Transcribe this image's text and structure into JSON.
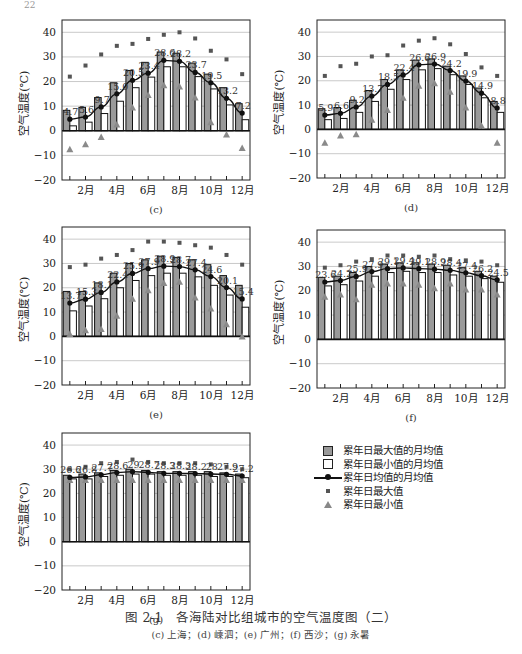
{
  "page_number": "22",
  "legend": {
    "items": [
      {
        "symbol": "gray-box",
        "label": "累年日最大值的月均值"
      },
      {
        "symbol": "white-box",
        "label": "累年日最小值的月均值"
      },
      {
        "symbol": "line-dot",
        "label": "累年日均值的月均值"
      },
      {
        "symbol": "small-square",
        "label": "累年日最大值"
      },
      {
        "symbol": "triangle",
        "label": "累年日最小值"
      }
    ]
  },
  "caption": {
    "title": "图 2-1　各海陆对比组城市的空气温度图（二）",
    "subtitle": "(c) 上海；(d) 嵊泗；(e) 广州；(f) 西沙；(g) 永暑"
  },
  "colors": {
    "bar_max_fill": "#9a9a9a",
    "bar_min_fill": "#ffffff",
    "bar_stroke": "#111111",
    "mean_line": "#111111",
    "extreme_max": "#555555",
    "extreme_min": "#8a8a8a",
    "gridline": "#bbbbbb"
  },
  "chart_data": [
    {
      "id": "c",
      "panel_label": "(c)",
      "type": "bar",
      "title": "",
      "xlabel": "",
      "ylabel": "空气温度(℃)",
      "ylim": [
        -20,
        45
      ],
      "yticks": [
        -20,
        -10,
        0,
        10,
        20,
        30,
        40
      ],
      "grid": true,
      "categories": [
        "1月",
        "2月",
        "3月",
        "4月",
        "5月",
        "6月",
        "7月",
        "8月",
        "9月",
        "10月",
        "11月",
        "12月"
      ],
      "xtick_labels": [
        "2月",
        "4月",
        "6月",
        "8月",
        "10月",
        "12月"
      ],
      "series": [
        {
          "name": "累年日最大值的月均值",
          "kind": "bar",
          "values": [
            8.3,
            9.5,
            13.5,
            19.5,
            24.5,
            27.8,
            32.0,
            31.5,
            27.5,
            23.0,
            17.5,
            11.0
          ]
        },
        {
          "name": "累年日最小值的月均值",
          "kind": "bar",
          "values": [
            2.0,
            3.5,
            7.0,
            12.0,
            17.5,
            21.8,
            26.0,
            26.0,
            22.0,
            17.0,
            10.5,
            4.5
          ]
        },
        {
          "name": "累年日均值的月均值",
          "kind": "line",
          "values": [
            4.7,
            5.6,
            9.7,
            15.0,
            20.5,
            23.4,
            28.6,
            28.2,
            23.7,
            19.5,
            13.2,
            7.2
          ],
          "labels": [
            "4.7",
            "5.6",
            "9.7",
            "15.0",
            "20.5",
            "23.4",
            "28.6",
            "28.2",
            "23.7",
            "19.5",
            "13.2",
            "7.2"
          ]
        },
        {
          "name": "累年日最大值",
          "kind": "scatter-square",
          "values": [
            22.0,
            26.5,
            31.0,
            34.5,
            35.3,
            37.3,
            39.0,
            40.0,
            37.5,
            32.5,
            29.0,
            23.0
          ]
        },
        {
          "name": "累年日最小值",
          "kind": "scatter-triangle",
          "values": [
            -7.5,
            -5.5,
            -2.5,
            2.5,
            9.5,
            14.5,
            18.5,
            18.0,
            13.5,
            3.5,
            -1.5,
            -7.0
          ]
        }
      ]
    },
    {
      "id": "d",
      "panel_label": "(d)",
      "type": "bar",
      "title": "",
      "xlabel": "",
      "ylabel": "空气温度(℃)",
      "ylim": [
        -20,
        45
      ],
      "yticks": [
        -20,
        -10,
        0,
        10,
        20,
        30,
        40
      ],
      "grid": true,
      "categories": [
        "1月",
        "2月",
        "3月",
        "4月",
        "5月",
        "6月",
        "7月",
        "8月",
        "9月",
        "10月",
        "11月",
        "12月"
      ],
      "xtick_labels": [
        "2月",
        "4月",
        "6月",
        "8月",
        "10月",
        "12月"
      ],
      "series": [
        {
          "name": "累年日最大值的月均值",
          "kind": "bar",
          "values": [
            8.5,
            9.0,
            12.0,
            16.0,
            20.5,
            24.5,
            28.5,
            29.0,
            26.0,
            22.0,
            17.0,
            11.5
          ]
        },
        {
          "name": "累年日最小值的月均值",
          "kind": "bar",
          "values": [
            4.0,
            4.5,
            7.0,
            11.5,
            16.5,
            20.5,
            24.5,
            25.0,
            22.5,
            18.5,
            13.0,
            7.0
          ]
        },
        {
          "name": "累年日均值的月均值",
          "kind": "line",
          "values": [
            5.9,
            6.6,
            9.2,
            13.7,
            18.5,
            22.4,
            26.6,
            26.9,
            24.2,
            19.9,
            14.9,
            8.8
          ],
          "labels": [
            "5.9",
            "6.6",
            "9.2",
            "13.7",
            "18.5",
            "22.4",
            "26.6",
            "26.9",
            "24.2",
            "19.9",
            "14.9",
            "8.8"
          ]
        },
        {
          "name": "累年日最大值",
          "kind": "scatter-square",
          "values": [
            22.0,
            26.0,
            27.0,
            30.0,
            30.5,
            34.5,
            36.5,
            37.5,
            35.0,
            31.0,
            25.5,
            22.0
          ]
        },
        {
          "name": "累年日最小值",
          "kind": "scatter-triangle",
          "values": [
            -5.5,
            -2.5,
            -2.0,
            4.0,
            8.0,
            13.0,
            18.0,
            19.0,
            15.5,
            9.0,
            1.5,
            -5.5
          ]
        }
      ]
    },
    {
      "id": "e",
      "panel_label": "(e)",
      "type": "bar",
      "title": "",
      "xlabel": "",
      "ylabel": "空气温度(℃)",
      "ylim": [
        -20,
        45
      ],
      "yticks": [
        -20,
        -10,
        0,
        10,
        20,
        30,
        40
      ],
      "grid": true,
      "categories": [
        "1月",
        "2月",
        "3月",
        "4月",
        "5月",
        "6月",
        "7月",
        "8月",
        "9月",
        "10月",
        "11月",
        "12月"
      ],
      "xtick_labels": [
        "2月",
        "4月",
        "6月",
        "8月",
        "10月",
        "12月"
      ],
      "series": [
        {
          "name": "累年日最大值的月均值",
          "kind": "bar",
          "values": [
            18.5,
            18.5,
            22.0,
            26.0,
            30.0,
            31.5,
            33.0,
            32.5,
            31.5,
            29.5,
            25.0,
            21.0
          ]
        },
        {
          "name": "累年日最小值的月均值",
          "kind": "bar",
          "values": [
            10.5,
            12.5,
            15.5,
            20.0,
            23.0,
            25.0,
            26.0,
            26.0,
            24.5,
            21.0,
            17.0,
            12.0
          ]
        },
        {
          "name": "累年日均值的月均值",
          "kind": "line",
          "values": [
            13.7,
            15.3,
            18.1,
            22.4,
            25.9,
            27.9,
            28.9,
            28.7,
            27.4,
            24.6,
            20.1,
            15.4
          ],
          "labels": [
            "13.7",
            "15.3",
            "18.1",
            "22.4",
            "25.9",
            "27.9",
            "28.9",
            "28.7",
            "27.4",
            "24.6",
            "20.1",
            "15.4"
          ]
        },
        {
          "name": "累年日最大值",
          "kind": "scatter-square",
          "values": [
            28.5,
            29.5,
            32.0,
            33.5,
            35.5,
            39.0,
            39.0,
            38.5,
            37.5,
            36.5,
            33.5,
            29.5
          ]
        },
        {
          "name": "累年日最小值",
          "kind": "scatter-triangle",
          "values": [
            1.0,
            2.5,
            3.0,
            8.5,
            15.5,
            19.0,
            22.0,
            22.5,
            16.0,
            11.5,
            5.0,
            0.0
          ]
        }
      ]
    },
    {
      "id": "f",
      "panel_label": "(f)",
      "type": "bar",
      "title": "",
      "xlabel": "",
      "ylabel": "空气温度(℃)",
      "ylim": [
        -20,
        45
      ],
      "yticks": [
        -20,
        -10,
        0,
        10,
        20,
        30,
        40
      ],
      "grid": true,
      "categories": [
        "1月",
        "2月",
        "3月",
        "4月",
        "5月",
        "6月",
        "7月",
        "8月",
        "9月",
        "10月",
        "11月",
        "12月"
      ],
      "xtick_labels": [
        "2月",
        "4月",
        "6月",
        "8月",
        "10月",
        "12月"
      ],
      "series": [
        {
          "name": "累年日最大值的月均值",
          "kind": "bar",
          "values": [
            25.5,
            26.0,
            27.5,
            30.0,
            31.0,
            31.5,
            31.5,
            31.0,
            30.5,
            29.5,
            28.0,
            26.0
          ]
        },
        {
          "name": "累年日最小值的月均值",
          "kind": "bar",
          "values": [
            22.0,
            22.5,
            24.0,
            26.0,
            27.5,
            28.0,
            27.5,
            27.5,
            26.5,
            26.0,
            25.0,
            23.5
          ]
        },
        {
          "name": "累年日均值的月均值",
          "kind": "line",
          "values": [
            23.6,
            24.2,
            25.9,
            27.9,
            29.1,
            29.4,
            29.1,
            28.9,
            28.4,
            27.4,
            26.2,
            24.5
          ],
          "labels": [
            "23.6",
            "24.2",
            "25.9",
            "27.9",
            "29.1",
            "29.4",
            "29.1",
            "28.9",
            "28.4",
            "27.4",
            "26.2",
            "24.5"
          ]
        },
        {
          "name": "累年日最大值",
          "kind": "scatter-square",
          "values": [
            29.5,
            30.5,
            32.0,
            33.0,
            34.5,
            34.5,
            34.0,
            34.5,
            33.0,
            32.5,
            32.0,
            30.5
          ]
        },
        {
          "name": "累年日最小值",
          "kind": "scatter-triangle",
          "values": [
            17.5,
            18.5,
            16.5,
            22.5,
            23.0,
            23.0,
            22.5,
            21.0,
            23.0,
            20.5,
            20.5,
            18.5
          ]
        }
      ]
    },
    {
      "id": "g",
      "panel_label": "(g)",
      "type": "bar",
      "title": "",
      "xlabel": "",
      "ylabel": "空气温度(℃)",
      "ylim": [
        -20,
        45
      ],
      "yticks": [
        -20,
        -10,
        0,
        10,
        20,
        30,
        40
      ],
      "grid": true,
      "categories": [
        "1月",
        "2月",
        "3月",
        "4月",
        "5月",
        "6月",
        "7月",
        "8月",
        "9月",
        "10月",
        "11月",
        "12月"
      ],
      "xtick_labels": [
        "2月",
        "4月",
        "6月",
        "8月",
        "10月",
        "12月"
      ],
      "series": [
        {
          "name": "累年日最大值的月均值",
          "kind": "bar",
          "values": [
            27.5,
            28.0,
            28.5,
            29.5,
            30.0,
            29.5,
            29.0,
            29.0,
            29.0,
            29.0,
            28.5,
            28.0
          ]
        },
        {
          "name": "累年日最小值的月均值",
          "kind": "bar",
          "values": [
            26.0,
            26.0,
            27.0,
            27.5,
            28.0,
            28.0,
            27.5,
            27.5,
            27.5,
            27.0,
            27.0,
            26.5
          ]
        },
        {
          "name": "累年日均值的月均值",
          "kind": "line",
          "values": [
            26.6,
            26.8,
            27.7,
            28.6,
            29.0,
            28.7,
            28.3,
            28.3,
            28.2,
            28.0,
            27.9,
            27.2
          ],
          "labels": [
            "26.6",
            "26.8",
            "27.7",
            "28.6",
            "29",
            "28.7",
            "28.3",
            "28.3",
            "28.2",
            "28",
            "27.9",
            "27.2"
          ]
        },
        {
          "name": "累年日最大值",
          "kind": "scatter-square",
          "values": [
            30.0,
            31.0,
            32.5,
            33.0,
            34.0,
            33.0,
            32.5,
            32.5,
            32.5,
            32.0,
            31.0,
            30.0
          ]
        },
        {
          "name": "累年日最小值",
          "kind": "scatter-triangle",
          "values": [
            25.5,
            25.5,
            25.5,
            25.5,
            25.5,
            25.5,
            25.5,
            25.5,
            25.5,
            25.5,
            25.5,
            25.5
          ]
        }
      ]
    }
  ]
}
